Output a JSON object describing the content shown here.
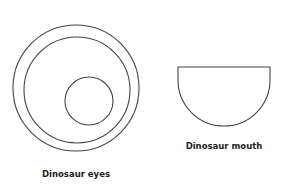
{
  "diagram": {
    "items": [
      {
        "id": "eyes",
        "label": "Dinosaur eyes",
        "shape": "three circles (outer ring, inner ring, small offset pupil)"
      },
      {
        "id": "mouth",
        "label": "Dinosaur mouth",
        "shape": "half circle (flat edge on top)"
      }
    ],
    "stroke_color": "#444444",
    "text_color": "#222222",
    "background": "#ffffff"
  }
}
